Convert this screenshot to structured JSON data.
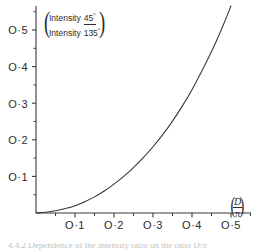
{
  "figure": {
    "background_color": "#ffffff",
    "axis_color": "#3a3a3a",
    "curve_color": "#333333"
  },
  "ylabel": {
    "left_paren": "(",
    "right_paren": ")",
    "numerator_word": "Intensity",
    "numerator_value": "45",
    "numerator_degree": "°",
    "denominator_word": "Intensity",
    "denominator_value": "135",
    "denominator_degree": "°"
  },
  "xlabel": {
    "left_paren": "(",
    "right_paren": ")",
    "numerator": "D",
    "denominator": "π"
  },
  "caption": {
    "text": "4.4.2  Dependence of the intensity ratio on the ratio D/π"
  },
  "chart_data": {
    "type": "line",
    "title": "",
    "subtitle": "",
    "xlabel": "(D/π)",
    "ylabel": "(Intensity 45° / Intensity 135°)",
    "xlim": [
      0,
      0.5
    ],
    "ylim": [
      0,
      0.59
    ],
    "grid": false,
    "legend": null,
    "x_ticks": [
      0.1,
      0.2,
      0.3,
      0.4,
      0.5
    ],
    "x_tick_labels": [
      "O·1",
      "O·2",
      "O·3",
      "O·4",
      "O·5"
    ],
    "y_ticks": [
      0.1,
      0.2,
      0.3,
      0.4,
      0.5
    ],
    "y_tick_labels": [
      "O·1",
      "O·2",
      "O·3",
      "O·4",
      "O·5"
    ],
    "x_minor_ticks": [
      0.05,
      0.15,
      0.25,
      0.35,
      0.45
    ],
    "y_minor_ticks": [
      0.05,
      0.15,
      0.25,
      0.35,
      0.45,
      0.55
    ],
    "series": [
      {
        "name": "intensity-ratio",
        "x": [
          0.0,
          0.025,
          0.05,
          0.075,
          0.1,
          0.125,
          0.15,
          0.175,
          0.2,
          0.225,
          0.25,
          0.275,
          0.3,
          0.325,
          0.35,
          0.375,
          0.4,
          0.425,
          0.45,
          0.465,
          0.48,
          0.5
        ],
        "y": [
          0.0,
          0.002,
          0.006,
          0.012,
          0.02,
          0.031,
          0.044,
          0.06,
          0.079,
          0.1,
          0.124,
          0.151,
          0.181,
          0.214,
          0.251,
          0.292,
          0.337,
          0.387,
          0.441,
          0.476,
          0.513,
          0.566
        ]
      }
    ]
  }
}
